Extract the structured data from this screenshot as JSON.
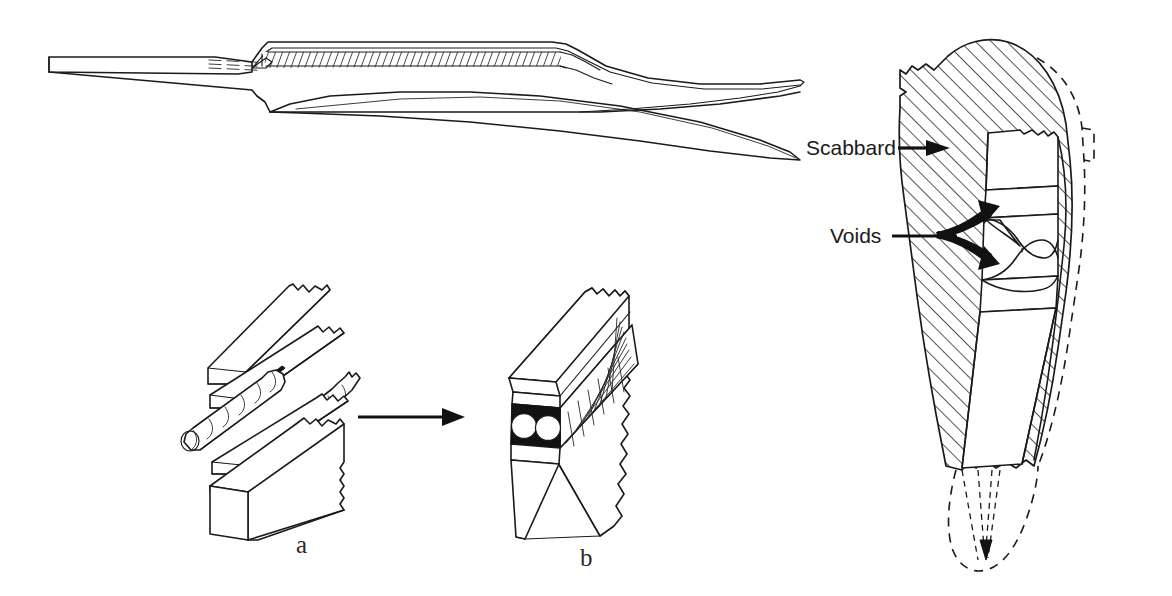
{
  "figure": {
    "background_color": "#ffffff",
    "ink_color": "#1a1a1a",
    "panels": [
      {
        "id": "sword-profile",
        "name": "sword-side-profile",
        "description": "Side profile of a sword blade with tang at left, peened hatched spine band, and curved point at right"
      },
      {
        "id": "panel-a",
        "name": "exploded-billet-assembly",
        "letter": "a",
        "description": "Exploded isometric view of flat bars and twisted rods before forge welding"
      },
      {
        "id": "panel-b",
        "name": "assembled-billet",
        "letter": "b",
        "description": "Assembled isometric billet showing layered edge, two round voids and tapered blade section"
      },
      {
        "id": "cross-section",
        "name": "scabbard-cross-section",
        "description": "Hatched cross-section of blade seated in scabbard with voids indicated"
      }
    ]
  },
  "labels": {
    "scabbard": "Scabbard",
    "voids": "Voids",
    "panel_a_letter": "a",
    "panel_b_letter": "b"
  },
  "annotations": {
    "transform_arrow": "arrow-from-exploded-to-assembled",
    "scabbard_arrow": "arrow-pointing-to-scabbard-wall",
    "voids_arrow": "forked-arrow-pointing-to-two-voids"
  },
  "colors": {
    "ink": "#1a1a1a",
    "paper": "#ffffff",
    "void_fill": "#121212",
    "hatch": "#1a1a1a"
  }
}
